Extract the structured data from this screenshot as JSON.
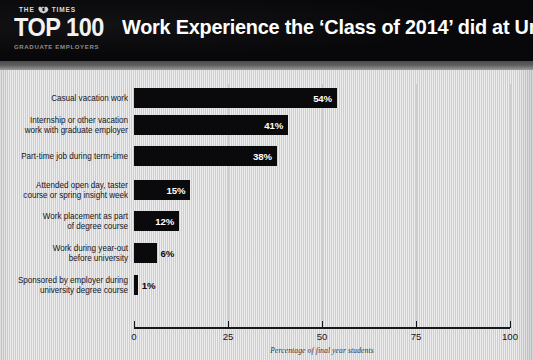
{
  "header": {
    "masthead": "THE",
    "masthead_suffix": "TIMES",
    "crest_icon": "times-crest-icon",
    "logo_main": "TOP 100",
    "logo_sub": "GRADUATE EMPLOYERS",
    "title": "Work Experience the ‘Class of 2014’ did at University",
    "background_color": "#08080a",
    "text_color": "#ffffff"
  },
  "chart_data": {
    "type": "bar",
    "orientation": "horizontal",
    "title": "Work Experience the ‘Class of 2014’ did at University",
    "subtitle": "",
    "xlabel": "Percentage of final year students",
    "ylabel": "",
    "categories": [
      "Casual vacation work",
      "Internship or other vacation\nwork with graduate employer",
      "Part-time job during term-time",
      "Attended open day, taster\ncourse or spring insight week",
      "Work placement as part\nof degree course",
      "Work during year-out\nbefore university",
      "Sponsored by employer during\nuniversity degree course"
    ],
    "values": [
      54,
      41,
      38,
      15,
      12,
      6,
      1
    ],
    "value_labels": [
      "54%",
      "41%",
      "38%",
      "15%",
      "12%",
      "6%",
      "1%"
    ],
    "xlim": [
      0,
      100
    ],
    "xticks": [
      0,
      25,
      50,
      75,
      100
    ],
    "xtick_labels": [
      "0",
      "25",
      "50",
      "75",
      "100"
    ],
    "grid": true,
    "legend": false,
    "bar_color": "#0a0a0c",
    "background_color": "#d6d6d6"
  }
}
